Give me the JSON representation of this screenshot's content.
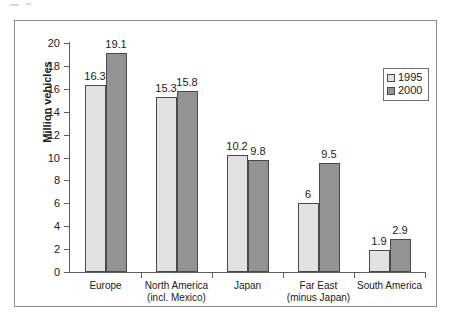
{
  "chart_data": {
    "type": "bar",
    "title": "",
    "xlabel": "",
    "ylabel": "Million vehicles",
    "ylim": [
      0,
      20
    ],
    "ytick_step": 2,
    "yticks": [
      "20",
      "18",
      "16",
      "14",
      "12",
      "10",
      "8",
      "6",
      "4",
      "2",
      "0"
    ],
    "grid": false,
    "legend_position": "top-right",
    "categories": [
      {
        "line1": "Europe",
        "line2": ""
      },
      {
        "line1": "North America",
        "line2": "(incl. Mexico)"
      },
      {
        "line1": "Japan",
        "line2": ""
      },
      {
        "line1": "Far East",
        "line2": "(minus Japan)"
      },
      {
        "line1": "South America",
        "line2": ""
      }
    ],
    "series": [
      {
        "name": "1995",
        "color": "#e2e2e2",
        "values": [
          16.3,
          15.3,
          10.2,
          6,
          1.9
        ],
        "labels": [
          "16.3",
          "15.3",
          "10.2",
          "6",
          "1.9"
        ]
      },
      {
        "name": "2000",
        "color": "#939393",
        "values": [
          19.1,
          15.8,
          9.8,
          9.5,
          2.9
        ],
        "labels": [
          "19.1",
          "15.8",
          "9.8",
          "9.5",
          "2.9"
        ]
      }
    ]
  },
  "legend": {
    "items": [
      {
        "label": "1995"
      },
      {
        "label": "2000"
      }
    ]
  }
}
